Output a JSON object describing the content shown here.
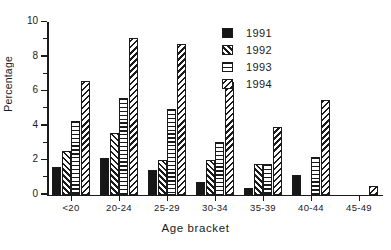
{
  "chart_data": {
    "type": "bar",
    "title": "",
    "subtitle": "",
    "xlabel": "Age bracket",
    "ylabel": "Percentage",
    "categories": [
      "<20",
      "20-24",
      "25-29",
      "30-34",
      "35-39",
      "40-44",
      "45-49"
    ],
    "series": [
      {
        "name": "1991",
        "pattern": "solid",
        "values": [
          1.6,
          2.1,
          1.4,
          0.7,
          0.4,
          1.15,
          0.0
        ]
      },
      {
        "name": "1992",
        "pattern": "fdiag",
        "values": [
          2.5,
          3.55,
          2.0,
          2.0,
          1.75,
          0.0,
          0.0
        ]
      },
      {
        "name": "1993",
        "pattern": "horiz",
        "values": [
          4.25,
          5.6,
          4.95,
          3.05,
          1.75,
          2.2,
          0.0
        ]
      },
      {
        "name": "1994",
        "pattern": "bdiag",
        "values": [
          6.6,
          9.05,
          8.75,
          6.55,
          3.9,
          5.5,
          0.5
        ]
      }
    ],
    "ylim": [
      0,
      10
    ],
    "yticks": [
      0,
      2,
      4,
      6,
      8,
      10
    ],
    "yticklabels": [
      "0",
      "2",
      "4",
      "6",
      "8",
      "10"
    ],
    "yminorticks": [
      1,
      3,
      5,
      7,
      9
    ],
    "grid": false,
    "legend_position": "top-right",
    "legend_entries": [
      "1991",
      "1992",
      "1993",
      "1994"
    ]
  },
  "axes": {
    "y_title": "Percentage",
    "x_title": "Age bracket"
  }
}
